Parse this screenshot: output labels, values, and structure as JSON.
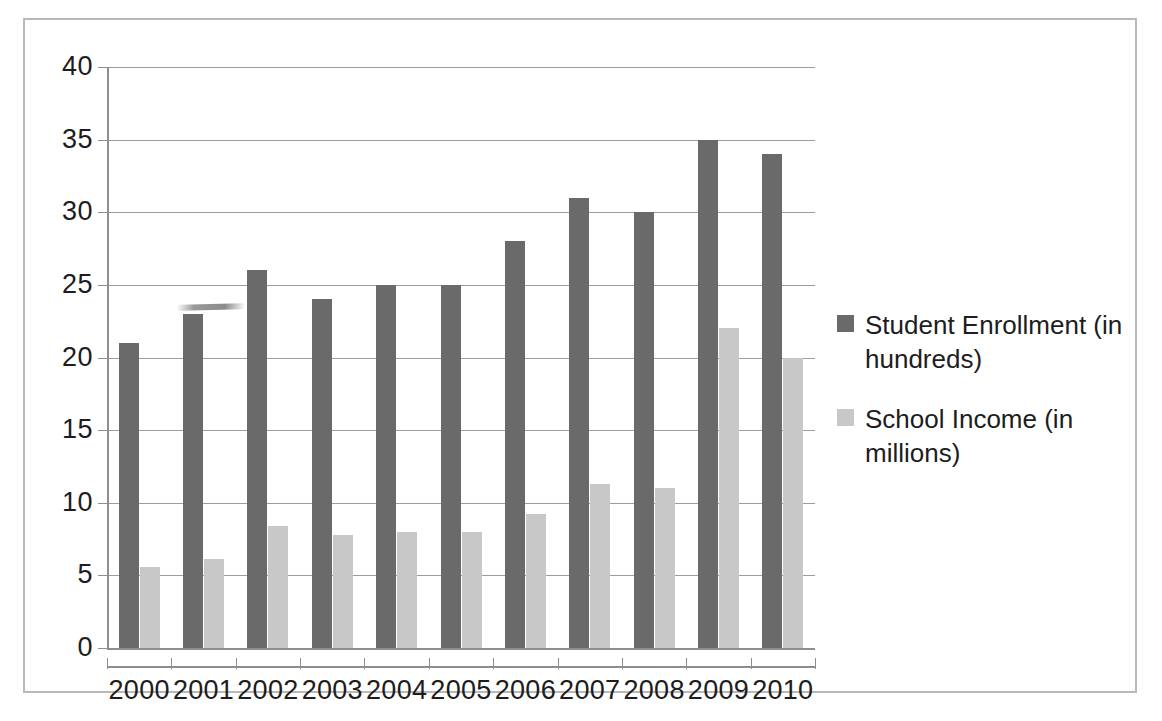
{
  "chart_data": {
    "type": "bar",
    "title": "",
    "xlabel": "",
    "ylabel": "",
    "categories": [
      "2000",
      "2001",
      "2002",
      "2003",
      "2004",
      "2005",
      "2006",
      "2007",
      "2008",
      "2009",
      "2010"
    ],
    "series": [
      {
        "name": "Student Enrollment (in hundreds)",
        "color": "#6a6a6a",
        "values": [
          21,
          23,
          26,
          24,
          25,
          25,
          28,
          31,
          30,
          35,
          34
        ]
      },
      {
        "name": "School Income (in millions)",
        "color": "#c8c8c8",
        "values": [
          5.6,
          6.1,
          8.4,
          7.8,
          8.0,
          8.0,
          9.2,
          11.3,
          11.0,
          22.0,
          20.0
        ]
      }
    ],
    "ylim": [
      0,
      40
    ],
    "ytick_step": 5,
    "yticks": [
      "40",
      "35",
      "30",
      "25",
      "20",
      "15",
      "10",
      "5",
      "0"
    ],
    "grid": true,
    "legend_position": "right"
  },
  "legend": {
    "entries": [
      {
        "label": "Student Enrollment (in hundreds)",
        "swatch": "dark-gray-swatch"
      },
      {
        "label": "School Income (in millions)",
        "swatch": "light-gray-swatch"
      }
    ]
  }
}
